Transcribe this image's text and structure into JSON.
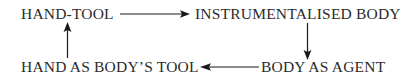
{
  "diagram": {
    "background_color": "#ffffff",
    "text_color": "#2b2b2b",
    "line_color": "#1a1a1a",
    "nodes": [
      {
        "id": "hand-tool",
        "label": "HAND-TOOL",
        "position": "top-left"
      },
      {
        "id": "instrumentalised-body",
        "label": "INSTRUMENTALISED BODY",
        "position": "top-right"
      },
      {
        "id": "hand-as-bodys-tool",
        "label": "HAND AS BODY’S TOOL",
        "position": "bottom-left"
      },
      {
        "id": "body-as-agent",
        "label": "BODY AS AGENT",
        "position": "bottom-right"
      }
    ],
    "edges": [
      {
        "id": "top-edge",
        "from": "hand-tool",
        "to": "instrumentalised-body",
        "direction": "right"
      },
      {
        "id": "right-edge",
        "from": "instrumentalised-body",
        "to": "body-as-agent",
        "direction": "down"
      },
      {
        "id": "bottom-edge",
        "from": "body-as-agent",
        "to": "hand-as-bodys-tool",
        "direction": "left"
      },
      {
        "id": "left-edge",
        "from": "hand-as-bodys-tool",
        "to": "hand-tool",
        "direction": "up"
      }
    ]
  }
}
